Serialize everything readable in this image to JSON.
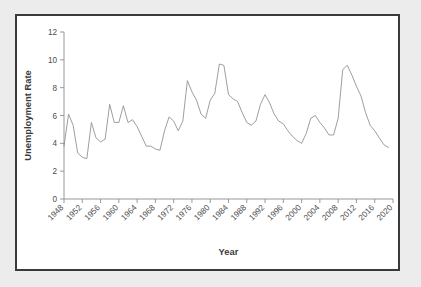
{
  "figure": {
    "background_color": "#ececed",
    "panel_color": "#ffffff",
    "border_color": "#3a3a3c",
    "line_color": "#8d8d8f"
  },
  "chart_data": {
    "type": "line",
    "title": "",
    "xlabel": "Year",
    "ylabel": "Unemployment Rate",
    "xlim": [
      1948,
      2020
    ],
    "ylim": [
      0,
      12
    ],
    "grid": false,
    "legend": false,
    "y_ticks": [
      0,
      2,
      4,
      6,
      8,
      10,
      12
    ],
    "x_ticks": [
      1948,
      1952,
      1956,
      1960,
      1964,
      1968,
      1972,
      1976,
      1980,
      1984,
      1988,
      1992,
      1996,
      2000,
      2004,
      2008,
      2012,
      2016,
      2020
    ],
    "x_tick_labels": [
      "1948",
      "1952",
      "1956",
      "1960",
      "1964",
      "1968",
      "1972",
      "1976",
      "1980",
      "1984",
      "1988",
      "1992",
      "1996",
      "2000",
      "2004",
      "2008",
      "2012",
      "2016",
      "2020"
    ],
    "y_tick_labels": [
      "0",
      "2",
      "4",
      "6",
      "8",
      "10",
      "12"
    ],
    "series": [
      {
        "name": "Unemployment Rate",
        "x": [
          1948,
          1949,
          1950,
          1951,
          1952,
          1953,
          1954,
          1955,
          1956,
          1957,
          1958,
          1959,
          1960,
          1961,
          1962,
          1963,
          1964,
          1965,
          1966,
          1967,
          1968,
          1969,
          1970,
          1971,
          1972,
          1973,
          1974,
          1975,
          1976,
          1977,
          1978,
          1979,
          1980,
          1981,
          1982,
          1983,
          1984,
          1985,
          1986,
          1987,
          1988,
          1989,
          1990,
          1991,
          1992,
          1993,
          1994,
          1995,
          1996,
          1997,
          1998,
          1999,
          2000,
          2001,
          2002,
          2003,
          2004,
          2005,
          2006,
          2007,
          2008,
          2009,
          2010,
          2011,
          2012,
          2013,
          2014,
          2015,
          2016,
          2017,
          2018,
          2019
        ],
        "values": [
          3.8,
          6.1,
          5.3,
          3.3,
          3.0,
          2.9,
          5.5,
          4.4,
          4.1,
          4.3,
          6.8,
          5.5,
          5.5,
          6.7,
          5.5,
          5.7,
          5.2,
          4.5,
          3.8,
          3.8,
          3.6,
          3.5,
          4.9,
          5.9,
          5.6,
          4.9,
          5.6,
          8.5,
          7.7,
          7.1,
          6.1,
          5.8,
          7.1,
          7.6,
          9.7,
          9.6,
          7.5,
          7.2,
          7.0,
          6.2,
          5.5,
          5.3,
          5.6,
          6.8,
          7.5,
          6.9,
          6.1,
          5.6,
          5.4,
          4.9,
          4.5,
          4.2,
          4.0,
          4.7,
          5.8,
          6.0,
          5.5,
          5.1,
          4.6,
          4.6,
          5.8,
          9.3,
          9.6,
          8.9,
          8.1,
          7.4,
          6.2,
          5.3,
          4.9,
          4.4,
          3.9,
          3.7
        ]
      }
    ],
    "max_point": {
      "year": 1983,
      "value": 10.0
    },
    "min_point": {
      "year": 1953,
      "value": 2.5
    }
  }
}
